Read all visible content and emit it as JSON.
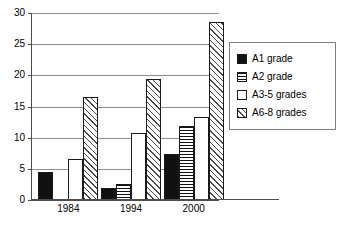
{
  "chart_data": {
    "type": "bar",
    "title": "",
    "subtitle": "",
    "xlabel": "",
    "ylabel": "",
    "categories": [
      "1984",
      "1994",
      "2000"
    ],
    "series": [
      {
        "name": "A1 grade",
        "pattern": "solid-black",
        "values": [
          4.5,
          2.0,
          7.4
        ]
      },
      {
        "name": "A2 grade",
        "pattern": "horizontal-lines",
        "values": [
          null,
          2.6,
          11.9
        ]
      },
      {
        "name": "A3-5 grades",
        "pattern": "white-empty",
        "values": [
          6.6,
          10.7,
          13.3
        ]
      },
      {
        "name": "A6-8 grades",
        "pattern": "diagonal-hatch",
        "values": [
          16.5,
          19.4,
          28.5
        ]
      }
    ],
    "ylim": [
      0,
      30
    ],
    "yticks": [
      0,
      5,
      10,
      15,
      20,
      25,
      30
    ],
    "ytick_labels": [
      "0",
      "5",
      "10",
      "15",
      "20",
      "25",
      "30"
    ],
    "grid": true,
    "grid_axis": "y",
    "legend_position": "right",
    "bar_group_order": [
      "A1 grade",
      "A2 grade",
      "A3-5 grades",
      "A6-8 grades"
    ]
  },
  "legend": {
    "items": [
      {
        "label": "A1 grade",
        "swatch": "solid-black-swatch"
      },
      {
        "label": "A2 grade",
        "swatch": "horizontal-lines-swatch"
      },
      {
        "label": "A3-5 grades",
        "swatch": "white-empty-swatch"
      },
      {
        "label": "A6-8 grades",
        "swatch": "diagonal-hatch-swatch"
      }
    ]
  },
  "colors": {
    "bar_outline": "#1a1a1a",
    "bar_solid": "#111111",
    "hatch": "#4a4a4a",
    "gridline": "#8c8c8c",
    "axis": "#4d4d4d",
    "background": "#ffffff",
    "legend_border": "#808080"
  }
}
